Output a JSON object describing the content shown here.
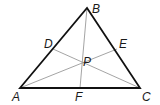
{
  "diagram": {
    "type": "triangle-cevians",
    "colors": {
      "triangle": "#111111",
      "cevians": "#9a9a9a",
      "labels": "#1a1a1a"
    },
    "points": {
      "A": {
        "label": "A",
        "x": 20,
        "y": 88
      },
      "B": {
        "label": "B",
        "x": 87,
        "y": 8
      },
      "C": {
        "label": "C",
        "x": 140,
        "y": 88
      },
      "D": {
        "label": "D",
        "x": 53,
        "y": 49
      },
      "E": {
        "label": "E",
        "x": 117,
        "y": 49
      },
      "F": {
        "label": "F",
        "x": 80,
        "y": 88
      },
      "P": {
        "label": "P",
        "x": 80,
        "y": 73
      }
    },
    "sides": [
      [
        "A",
        "B"
      ],
      [
        "B",
        "C"
      ],
      [
        "C",
        "A"
      ]
    ],
    "cevians": [
      [
        "B",
        "F"
      ],
      [
        "A",
        "E"
      ],
      [
        "C",
        "D"
      ]
    ],
    "label_positions": {
      "A": {
        "x": 12,
        "y": 101
      },
      "B": {
        "x": 92,
        "y": 13
      },
      "C": {
        "x": 142,
        "y": 101
      },
      "D": {
        "x": 44,
        "y": 48
      },
      "E": {
        "x": 119,
        "y": 48
      },
      "F": {
        "x": 75,
        "y": 101
      },
      "P": {
        "x": 83,
        "y": 66
      }
    }
  }
}
